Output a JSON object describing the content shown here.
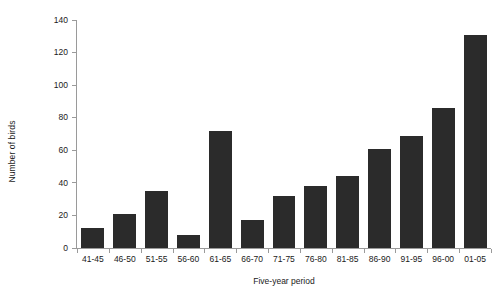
{
  "chart_data": {
    "type": "bar",
    "title": "",
    "subtitle": "",
    "xlabel": "Five-year period",
    "ylabel": "Number of birds",
    "categories": [
      "41-45",
      "46-50",
      "51-55",
      "56-60",
      "61-65",
      "66-70",
      "71-75",
      "76-80",
      "81-85",
      "86-90",
      "91-95",
      "96-00",
      "01-05"
    ],
    "values": [
      12,
      21,
      35,
      8,
      72,
      17,
      32,
      38,
      44,
      61,
      69,
      86,
      131
    ],
    "ylim": [
      0,
      140
    ],
    "yticks": [
      0,
      20,
      40,
      60,
      80,
      100,
      120,
      140
    ],
    "ytick_labels": [
      "0",
      "20",
      "40",
      "60",
      "80",
      "100",
      "120",
      "140"
    ],
    "grid": false,
    "legend": false,
    "bar_color": "#2b2b2b",
    "axis_color": "#9a9a9a",
    "text_color": "#1a1a1a",
    "background": "#ffffff"
  }
}
